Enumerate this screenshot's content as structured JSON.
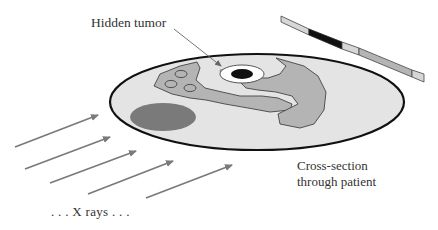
{
  "labels": {
    "hidden_tumor": "Hidden tumor",
    "cross_section_line1": "Cross-section",
    "cross_section_line2": "through patient",
    "x_rays": ". . . X rays . . ."
  },
  "colors": {
    "body_fill": "#e4e4e4",
    "body_outline": "#111111",
    "organ_fill": "#b4b4b4",
    "dark_organ_fill": "#7a7a7a",
    "tumor_fill": "#111111",
    "arrow_color": "#7a7a7a",
    "detector_light": "#d6d6d6",
    "detector_dark": "#111111",
    "detector_mid": "#b4b4b4"
  },
  "elements": {
    "arrow_count": 5,
    "detector_segments": [
      "light",
      "dark",
      "light",
      "mid",
      "light"
    ]
  }
}
